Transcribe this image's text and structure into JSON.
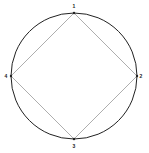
{
  "diagram": {
    "circle": {
      "cx": 74,
      "cy": 76,
      "r": 63,
      "stroke": "#222222"
    },
    "square_stroke": "#999999",
    "points": [
      {
        "label": "1",
        "x": 74,
        "y": 13
      },
      {
        "label": "2",
        "x": 137,
        "y": 76
      },
      {
        "label": "3",
        "x": 74,
        "y": 139
      },
      {
        "label": "4",
        "x": 11,
        "y": 76
      }
    ]
  }
}
